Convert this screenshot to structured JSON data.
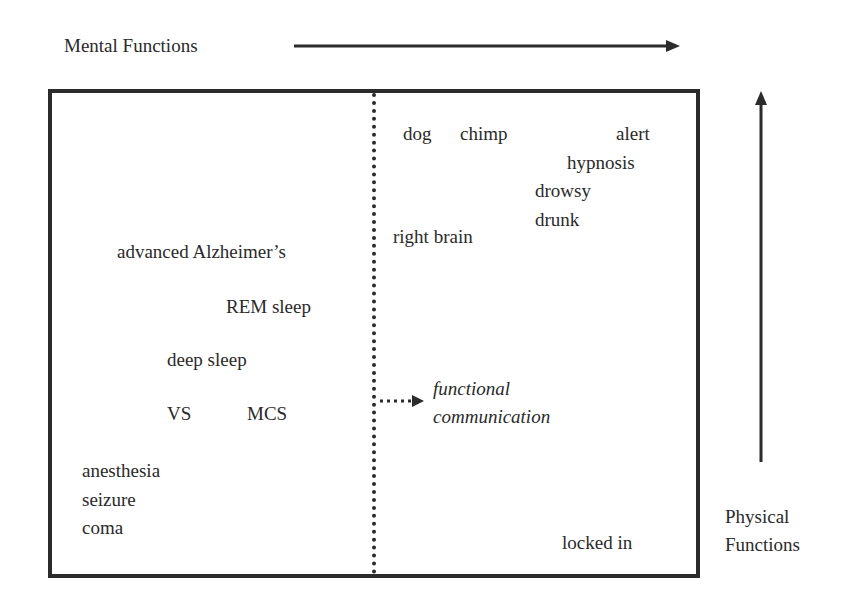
{
  "axes": {
    "x_label": "Mental Functions",
    "y_label_line1": "Physical",
    "y_label_line2": "Functions"
  },
  "left_region": {
    "items": [
      "advanced Alzheimer’s",
      "REM sleep",
      "deep sleep",
      "VS",
      "MCS",
      "anesthesia",
      "seizure",
      "coma"
    ]
  },
  "right_region": {
    "items": [
      "dog",
      "chimp",
      "alert",
      "hypnosis",
      "drowsy",
      "drunk",
      "right brain",
      "locked in"
    ]
  },
  "transition": {
    "line1": "functional",
    "line2": "communication"
  },
  "colors": {
    "ink": "#2b2b2b",
    "background": "#ffffff"
  }
}
